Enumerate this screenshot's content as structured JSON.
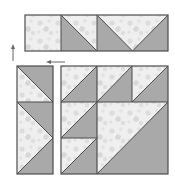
{
  "diagram": {
    "colors": {
      "print": "#eeeeee",
      "print_spot": "#dadada",
      "solid": "#a9a9a9",
      "seam": "#4d4d4d",
      "arrow": "#666666"
    },
    "top_row": {
      "units": [
        {
          "type": "plain-square",
          "fabric": "print"
        },
        {
          "type": "half-square-triangle",
          "diagonal": "top-left to bottom-right",
          "upper": "print",
          "lower": "solid"
        },
        {
          "type": "flying-geese",
          "goose": "print",
          "pointing": "down",
          "sky": "solid"
        }
      ]
    },
    "left_column": {
      "units": [
        {
          "type": "half-square-triangle",
          "diagonal": "top-left to bottom-right",
          "upper": "solid",
          "lower": "print"
        },
        {
          "type": "flying-geese",
          "goose": "print",
          "pointing": "right",
          "sky": "solid"
        }
      ]
    },
    "main_grid": {
      "units": [
        {
          "row": 1,
          "col": 1,
          "type": "half-square-triangle",
          "diagonal": "bottom-left to top-right",
          "upper": "print",
          "lower": "solid"
        },
        {
          "row": 1,
          "col": 2,
          "type": "half-square-triangle",
          "diagonal": "bottom-left to top-right",
          "upper": "print",
          "lower": "solid"
        },
        {
          "row": 1,
          "col": 3,
          "type": "half-square-triangle",
          "diagonal": "bottom-left to top-right",
          "upper": "print",
          "lower": "solid"
        },
        {
          "row": 2,
          "col": 1,
          "type": "half-square-triangle",
          "diagonal": "bottom-left to top-right",
          "upper": "print",
          "lower": "solid"
        },
        {
          "row": 3,
          "col": 1,
          "type": "half-square-triangle",
          "diagonal": "bottom-left to top-right",
          "upper": "print",
          "lower": "solid"
        },
        {
          "row": "2-3",
          "col": "2-3",
          "type": "large-half-square-triangle",
          "diagonal": "bottom-left to top-right",
          "upper": "print",
          "lower": "solid"
        }
      ]
    },
    "arrows": [
      {
        "direction": "up",
        "meaning": "join top row"
      },
      {
        "direction": "left",
        "meaning": "join left column"
      }
    ]
  }
}
